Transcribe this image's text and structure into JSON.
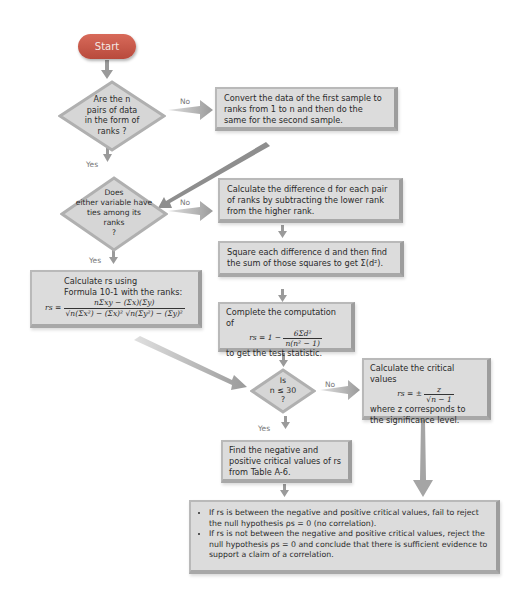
{
  "flowchart": {
    "start": {
      "label": "Start"
    },
    "decision1": {
      "line1": "Are the n",
      "line2": "pairs of data",
      "line3": "in the form of",
      "line4": "ranks ?"
    },
    "decision1_no": "No",
    "decision1_yes": "Yes",
    "convert_box": {
      "text": "Convert the data of the first sample to ranks from 1 to n and then do the same for the second sample."
    },
    "decision2": {
      "line1": "Does",
      "line2": "either variable have",
      "line3": "ties among its",
      "line4": "ranks",
      "line5": "?"
    },
    "decision2_no": "No",
    "decision2_yes": "Yes",
    "difference_box": {
      "text": "Calculate the difference d for each pair of ranks by subtracting the lower rank from the higher rank."
    },
    "square_box": {
      "text": "Square each difference d and then find the sum of those squares to get Σ(d²)."
    },
    "formula_box": {
      "line1": "Calculate rs using",
      "line2": "Formula 10-1 with the ranks:",
      "lhs": "rs =",
      "numerator": "nΣxy − (Σx)(Σy)",
      "denominator": "√n(Σx²) − (Σx)²  √n(Σy²) − (Σy)²"
    },
    "compute_box": {
      "line1": "Complete the computation of",
      "lhs": "rs = 1 −",
      "numerator": "6Σd²",
      "denominator": "n(n² − 1)",
      "line3": "to get the test statistic."
    },
    "decision3": {
      "line1": "Is",
      "line2": "n ≤ 30",
      "line3": "?"
    },
    "decision3_no": "No",
    "decision3_yes": "Yes",
    "critical_calc_box": {
      "line1": "Calculate the critical values",
      "lhs": "rs = ±",
      "numerator": "z",
      "denominator": "√n − 1",
      "line3": "where z corresponds to the significance level."
    },
    "table_box": {
      "text": "Find the negative and positive critical values of rs from Table A-6."
    },
    "conclusion_box": {
      "bullet1": "If rs is between the negative and positive critical values, fail to reject the null hypothesis ρs = 0 (no correlation).",
      "bullet2": "If rs is not between the negative and positive critical values, reject the null hypothesis ρs = 0 and conclude that there is sufficient evidence to support a claim of a correlation."
    },
    "colors": {
      "start": "#c85848",
      "box_fill": "#dcdcdc",
      "box_border": "#a8a8a8",
      "arrow": "#9a9a9a"
    }
  }
}
